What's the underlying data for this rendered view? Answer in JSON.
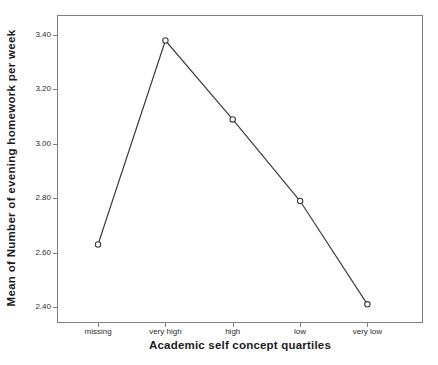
{
  "chart_data": {
    "type": "line",
    "title": "",
    "xlabel": "Academic self concept quartiles",
    "ylabel": "Mean of Number of evening homework per week",
    "categories": [
      "missing",
      "very high",
      "high",
      "low",
      "very low"
    ],
    "series": [
      {
        "name": "Mean of Number of evening homework per week",
        "values": [
          2.63,
          3.38,
          3.09,
          2.79,
          2.41
        ]
      }
    ],
    "ytick_labels": [
      "2.40",
      "2.60",
      "2.80",
      "3.00",
      "3.20",
      "3.40"
    ],
    "ytick_values": [
      2.4,
      2.6,
      2.8,
      3.0,
      3.2,
      3.4
    ],
    "ylim": [
      2.345,
      3.47
    ],
    "grid": false,
    "legend": "none",
    "marker": "open-circle",
    "colors": {
      "line": "#3d3d3d",
      "marker_stroke": "#3d3d3d",
      "marker_fill": "#ffffff",
      "frame": "#7f7f7f",
      "text": "#1c1c1c",
      "tick_text": "#2e2e2e",
      "background": "#ffffff"
    }
  }
}
